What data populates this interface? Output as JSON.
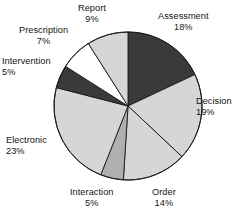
{
  "chart_data": {
    "type": "pie",
    "title": "",
    "subtitle": "",
    "xlabel": "",
    "ylabel": "",
    "legend_position": "none",
    "grid": false,
    "value_unit": "%",
    "start_angle_deg": 0,
    "direction": "clockwise",
    "categories": [
      "Assessment",
      "Decision",
      "Order",
      "Interaction",
      "Electronic",
      "Intervention",
      "Prescription",
      "Report"
    ],
    "values": [
      18,
      19,
      14,
      5,
      23,
      5,
      7,
      9
    ],
    "slices": [
      {
        "label": "Assessment",
        "value": 18,
        "value_text": "18%",
        "color": "#3a3a3a",
        "label_pos": {
          "x": 158,
          "y": 11
        },
        "align": "lab-center"
      },
      {
        "label": "Decision",
        "value": 19,
        "value_text": "19%",
        "color": "#d6d6d6",
        "label_pos": {
          "x": 196,
          "y": 96
        },
        "align": "lab-left"
      },
      {
        "label": "Order",
        "value": 14,
        "value_text": "14%",
        "color": "#d6d6d6",
        "label_pos": {
          "x": 152,
          "y": 187
        },
        "align": "lab-center"
      },
      {
        "label": "Interaction",
        "value": 5,
        "value_text": "5%",
        "color": "#b0b0b0",
        "label_pos": {
          "x": 70,
          "y": 187
        },
        "align": "lab-center"
      },
      {
        "label": "Electronic",
        "value": 23,
        "value_text": "23%",
        "color": "#d6d6d6",
        "label_pos": {
          "x": 6,
          "y": 135
        },
        "align": "lab-left"
      },
      {
        "label": "Intervention",
        "value": 5,
        "value_text": "5%",
        "color": "#3a3a3a",
        "label_pos": {
          "x": 2,
          "y": 56
        },
        "align": "lab-left"
      },
      {
        "label": "Prescription",
        "value": 7,
        "value_text": "7%",
        "color": "#ffffff",
        "label_pos": {
          "x": 19,
          "y": 25
        },
        "align": "lab-center"
      },
      {
        "label": "Report",
        "value": 9,
        "value_text": "9%",
        "color": "#d6d6d6",
        "label_pos": {
          "x": 78,
          "y": 3
        },
        "align": "lab-center"
      }
    ],
    "geometry": {
      "center_x": 128,
      "center_y": 106,
      "radius": 74
    },
    "colors": {
      "dark": "#3a3a3a",
      "light_gray": "#d6d6d6",
      "medium_gray": "#b0b0b0",
      "white": "#ffffff",
      "outline": "#1a1a1a",
      "text": "#141414"
    }
  }
}
